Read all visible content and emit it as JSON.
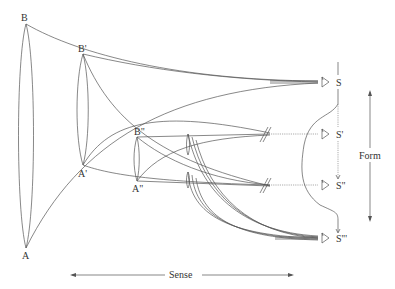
{
  "diagram": {
    "points": {
      "B": "B",
      "B1": "B'",
      "B2": "B\"",
      "A": "A",
      "A1": "A'",
      "A2": "A\"",
      "S": "S",
      "S1": "S'",
      "S2": "S\"",
      "S3": "S'''"
    },
    "axes": {
      "horizontal_label": "Sense",
      "vertical_label": "Form"
    },
    "icons": [
      "eye-icon-s",
      "eye-icon-s1",
      "eye-icon-s2",
      "eye-icon-s3"
    ],
    "colors": {
      "line": "#555555",
      "text": "#333333",
      "background": "#ffffff"
    }
  }
}
